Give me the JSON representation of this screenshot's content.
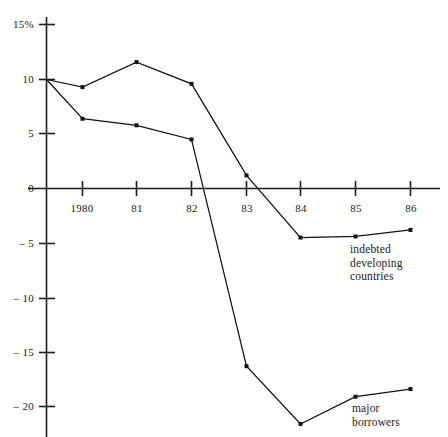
{
  "chart_data": {
    "type": "line",
    "title": "",
    "subtitle": "",
    "xlabel": "",
    "ylabel": "",
    "x": [
      "1980",
      "81",
      "82",
      "83",
      "84",
      "85",
      "86"
    ],
    "x_tick_labels": [
      "1980",
      "81",
      "82",
      "83",
      "84",
      "85",
      "86"
    ],
    "y_tick_labels": [
      "15%",
      "10",
      "5",
      "0",
      "– 5",
      "– 10",
      "– 15",
      "– 20"
    ],
    "y_tick_values": [
      15,
      10,
      5,
      0,
      -5,
      -10,
      -15,
      -20
    ],
    "ylim": [
      -22.5,
      15.5
    ],
    "xlim": [
      1979.2,
      1986.35
    ],
    "grid": false,
    "legend_position": "inline-annotation",
    "origin_value": 10,
    "series": [
      {
        "name": "indebted developing countries",
        "label_text": "indebted\ndeveloping\ncountries",
        "color": "#111111",
        "x": [
          "1979.3",
          "1980",
          "81",
          "82",
          "83",
          "84",
          "85",
          "86"
        ],
        "values": [
          10.0,
          9.3,
          11.6,
          9.6,
          1.2,
          -4.5,
          -4.4,
          -3.8
        ]
      },
      {
        "name": "major borrowers",
        "label_text": "major\nborrowers",
        "color": "#111111",
        "x": [
          "1979.3",
          "1980",
          "81",
          "82",
          "83",
          "84",
          "85",
          "86"
        ],
        "values": [
          10.0,
          6.4,
          5.8,
          4.5,
          -16.3,
          -21.6,
          -19.1,
          -18.4
        ]
      }
    ]
  },
  "annotations": {
    "indebted": "indebted\ndeveloping\ncountries",
    "major": "major\nborrowers"
  }
}
